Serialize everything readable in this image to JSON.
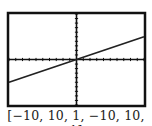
{
  "chart_data": {
    "type": "line",
    "title": "",
    "xlabel": "",
    "ylabel": "",
    "window": {
      "xmin": -10,
      "xmax": 10,
      "xscl": 1,
      "ymin": -10,
      "ymax": 10,
      "yscl": 1
    },
    "xlim": [
      -10,
      10
    ],
    "ylim": [
      -10,
      10
    ],
    "grid": false,
    "axes_ticks": true,
    "series": [
      {
        "name": "y = 0.5x",
        "x": [
          -10,
          10
        ],
        "y": [
          -5,
          5
        ]
      }
    ]
  },
  "caption": "[−10, 10, 1, −10, 10, 1]",
  "colors": {
    "frame": "#111111",
    "line": "#222222",
    "background": "#ffffff"
  }
}
